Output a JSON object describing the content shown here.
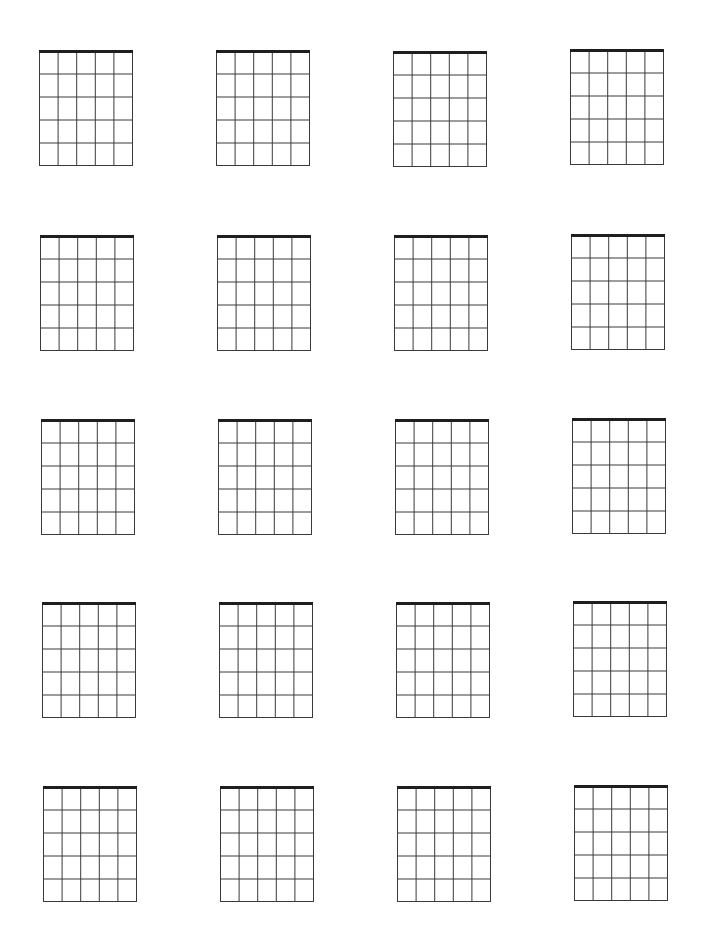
{
  "page": {
    "kind": "blank-guitar-chord-chart",
    "background": "#ffffff",
    "line_color": "#3a3a3a",
    "nut_color": "#1e1e1e"
  },
  "diagram_spec": {
    "strings": 6,
    "frets": 5,
    "width": 94,
    "height": 115,
    "nut_thickness": 3,
    "line_width": 1
  },
  "grid": {
    "rows": 5,
    "columns": 4,
    "diagrams": [
      {
        "row": 1,
        "col": 1,
        "x": 39,
        "y": 51
      },
      {
        "row": 1,
        "col": 2,
        "x": 216,
        "y": 51
      },
      {
        "row": 1,
        "col": 3,
        "x": 393,
        "y": 52
      },
      {
        "row": 1,
        "col": 4,
        "x": 570,
        "y": 50
      },
      {
        "row": 2,
        "col": 1,
        "x": 40,
        "y": 236
      },
      {
        "row": 2,
        "col": 2,
        "x": 217,
        "y": 236
      },
      {
        "row": 2,
        "col": 3,
        "x": 394,
        "y": 236
      },
      {
        "row": 2,
        "col": 4,
        "x": 571,
        "y": 235
      },
      {
        "row": 3,
        "col": 1,
        "x": 41,
        "y": 420
      },
      {
        "row": 3,
        "col": 2,
        "x": 218,
        "y": 420
      },
      {
        "row": 3,
        "col": 3,
        "x": 395,
        "y": 420
      },
      {
        "row": 3,
        "col": 4,
        "x": 572,
        "y": 419
      },
      {
        "row": 4,
        "col": 1,
        "x": 42,
        "y": 603
      },
      {
        "row": 4,
        "col": 2,
        "x": 219,
        "y": 603
      },
      {
        "row": 4,
        "col": 3,
        "x": 396,
        "y": 603
      },
      {
        "row": 4,
        "col": 4,
        "x": 573,
        "y": 602
      },
      {
        "row": 5,
        "col": 1,
        "x": 43,
        "y": 787
      },
      {
        "row": 5,
        "col": 2,
        "x": 220,
        "y": 787
      },
      {
        "row": 5,
        "col": 3,
        "x": 397,
        "y": 787
      },
      {
        "row": 5,
        "col": 4,
        "x": 574,
        "y": 786
      }
    ]
  }
}
